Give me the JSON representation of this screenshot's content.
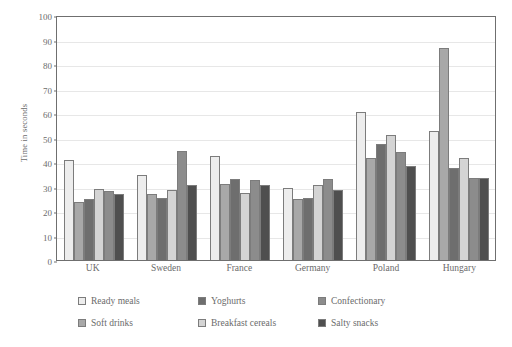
{
  "chart_data": {
    "type": "bar",
    "title": "",
    "xlabel": "",
    "ylabel": "Time in seconds",
    "ylim": [
      0,
      100
    ],
    "ytick_step": 10,
    "yticks": [
      0,
      10,
      20,
      30,
      40,
      50,
      60,
      70,
      80,
      90,
      100
    ],
    "grid": true,
    "legend_position": "bottom",
    "categories": [
      "UK",
      "Sweden",
      "France",
      "Germany",
      "Poland",
      "Hungary"
    ],
    "series": [
      {
        "name": "Ready meals",
        "color": "#ededed",
        "values": [
          41,
          34.5,
          42.5,
          29.5,
          60.5,
          52.5
        ]
      },
      {
        "name": "Soft drinks",
        "color": "#a8a8a8",
        "values": [
          23.5,
          27,
          31,
          25,
          41.5,
          86.5
        ]
      },
      {
        "name": "Yoghurts",
        "color": "#6e6e6e",
        "values": [
          25,
          25.5,
          33,
          25.5,
          47.5,
          37.5
        ]
      },
      {
        "name": "Breakfast cereals",
        "color": "#d4d4d4",
        "values": [
          29,
          28.5,
          27.5,
          30.5,
          51,
          41.5
        ]
      },
      {
        "name": "Confectionary",
        "color": "#8c8c8c",
        "values": [
          28,
          44.5,
          32.5,
          33,
          44,
          33.5
        ]
      },
      {
        "name": "Salty snacks",
        "color": "#4f4f4f",
        "values": [
          27,
          30.5,
          30.5,
          28.5,
          38.5,
          33.5
        ]
      }
    ]
  },
  "axis": {
    "y_title": "Time in seconds"
  }
}
